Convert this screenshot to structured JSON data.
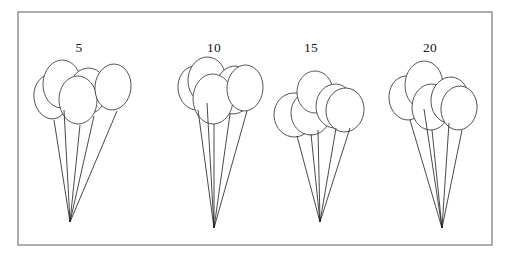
{
  "figure": {
    "type": "diagram",
    "title": "",
    "background_color": "#ffffff",
    "frame": {
      "name": "outer-border",
      "x": 18,
      "y": 12,
      "width": 474,
      "height": 233,
      "stroke_color": "#9a9a9a",
      "fill_color": "#ffffff",
      "stroke_width": 1.6
    },
    "balloon_stroke_color": "#3b3b3b",
    "string_stroke_color": "#1a1a1a",
    "label_color": "#141414",
    "balloons_per_bunch": 5
  },
  "bunches": [
    {
      "id": "bunch-1",
      "label": "5",
      "label_x": 79,
      "label_y": 52,
      "knot_x": 70,
      "knot_y": 222,
      "balloon_count": 5,
      "balloons": [
        {
          "cx": 51,
          "cy": 97,
          "rx": 17,
          "ry": 22,
          "rot": -8
        },
        {
          "cx": 62,
          "cy": 84,
          "rx": 19,
          "ry": 24,
          "rot": 2
        },
        {
          "cx": 88,
          "cy": 91,
          "rx": 19,
          "ry": 23,
          "rot": 4
        },
        {
          "cx": 78,
          "cy": 100,
          "rx": 19,
          "ry": 24,
          "rot": -2
        },
        {
          "cx": 113,
          "cy": 87,
          "rx": 18,
          "ry": 23,
          "rot": 6
        }
      ],
      "string_tops": [
        {
          "x": 54,
          "y": 120
        },
        {
          "x": 64,
          "y": 110
        },
        {
          "x": 80,
          "y": 125
        },
        {
          "x": 94,
          "y": 116
        },
        {
          "x": 117,
          "y": 111
        }
      ]
    },
    {
      "id": "bunch-2",
      "label": "10",
      "label_x": 214,
      "label_y": 52,
      "knot_x": 214,
      "knot_y": 228,
      "balloon_count": 5,
      "balloons": [
        {
          "cx": 196,
          "cy": 88,
          "rx": 18,
          "ry": 22,
          "rot": -6
        },
        {
          "cx": 207,
          "cy": 80,
          "rx": 19,
          "ry": 23,
          "rot": 3
        },
        {
          "cx": 234,
          "cy": 90,
          "rx": 19,
          "ry": 24,
          "rot": 5
        },
        {
          "cx": 213,
          "cy": 99,
          "rx": 20,
          "ry": 25,
          "rot": -1
        },
        {
          "cx": 245,
          "cy": 88,
          "rx": 18,
          "ry": 23,
          "rot": 4
        }
      ],
      "string_tops": [
        {
          "x": 198,
          "y": 110
        },
        {
          "x": 207,
          "y": 103
        },
        {
          "x": 214,
          "y": 124
        },
        {
          "x": 230,
          "y": 114
        },
        {
          "x": 247,
          "y": 111
        }
      ]
    },
    {
      "id": "bunch-3",
      "label": "15",
      "label_x": 311,
      "label_y": 52,
      "knot_x": 320,
      "knot_y": 222,
      "balloon_count": 5,
      "balloons": [
        {
          "cx": 294,
          "cy": 115,
          "rx": 20,
          "ry": 22,
          "rot": -4
        },
        {
          "cx": 311,
          "cy": 113,
          "rx": 20,
          "ry": 22,
          "rot": 2
        },
        {
          "cx": 315,
          "cy": 92,
          "rx": 18,
          "ry": 21,
          "rot": 0
        },
        {
          "cx": 335,
          "cy": 106,
          "rx": 19,
          "ry": 22,
          "rot": 3
        },
        {
          "cx": 345,
          "cy": 110,
          "rx": 19,
          "ry": 22,
          "rot": 5
        }
      ],
      "string_tops": [
        {
          "x": 297,
          "y": 136
        },
        {
          "x": 311,
          "y": 134
        },
        {
          "x": 318,
          "y": 130
        },
        {
          "x": 336,
          "y": 128
        },
        {
          "x": 350,
          "y": 128
        }
      ]
    },
    {
      "id": "bunch-4",
      "label": "20",
      "label_x": 430,
      "label_y": 52,
      "knot_x": 442,
      "knot_y": 228,
      "balloon_count": 5,
      "balloons": [
        {
          "cx": 407,
          "cy": 98,
          "rx": 18,
          "ry": 22,
          "rot": -6
        },
        {
          "cx": 424,
          "cy": 85,
          "rx": 19,
          "ry": 24,
          "rot": 1
        },
        {
          "cx": 431,
          "cy": 107,
          "rx": 19,
          "ry": 23,
          "rot": 3
        },
        {
          "cx": 450,
          "cy": 100,
          "rx": 19,
          "ry": 23,
          "rot": 5
        },
        {
          "cx": 459,
          "cy": 108,
          "rx": 18,
          "ry": 22,
          "rot": 7
        }
      ],
      "string_tops": [
        {
          "x": 410,
          "y": 120
        },
        {
          "x": 424,
          "y": 109
        },
        {
          "x": 432,
          "y": 130
        },
        {
          "x": 449,
          "y": 123
        },
        {
          "x": 462,
          "y": 130
        }
      ]
    }
  ]
}
